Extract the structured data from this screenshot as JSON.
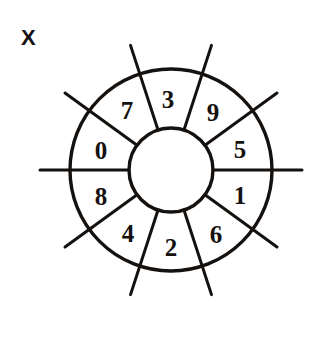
{
  "figure": {
    "panel_label": "X",
    "panel_label_pos": {
      "x": 21,
      "y": 37
    },
    "background_color": "#ffffff",
    "ink_color": "#14110f",
    "center": {
      "x": 171,
      "y": 170
    },
    "outer_radius": 101,
    "inner_radius": 42,
    "outer_stroke_width": 3.4,
    "inner_stroke_width": 3.4,
    "spoke_stroke_width": 3.0,
    "spoke_outer_extent": 131,
    "sectors": [
      {
        "label": "3",
        "angle_deg": 90,
        "label_x": 168,
        "label_y": 99
      },
      {
        "label": "7",
        "angle_deg": 126,
        "label_x": 127,
        "label_y": 110
      },
      {
        "label": "0",
        "angle_deg": 162,
        "label_x": 101,
        "label_y": 150
      },
      {
        "label": "8",
        "angle_deg": 198,
        "label_x": 101,
        "label_y": 196
      },
      {
        "label": "4",
        "angle_deg": 234,
        "label_x": 128,
        "label_y": 233
      },
      {
        "label": "2",
        "angle_deg": 270,
        "label_x": 171,
        "label_y": 247
      },
      {
        "label": "6",
        "angle_deg": 306,
        "label_x": 216,
        "label_y": 234
      },
      {
        "label": "1",
        "angle_deg": 342,
        "label_x": 240,
        "label_y": 195
      },
      {
        "label": "5",
        "angle_deg": 18,
        "label_x": 240,
        "label_y": 149
      },
      {
        "label": "9",
        "angle_deg": 54,
        "label_x": 213,
        "label_y": 112
      }
    ],
    "divider_angles_deg": [
      0,
      36,
      72,
      108,
      144,
      180,
      216,
      252,
      288,
      324
    ],
    "spoke_count": 10
  }
}
